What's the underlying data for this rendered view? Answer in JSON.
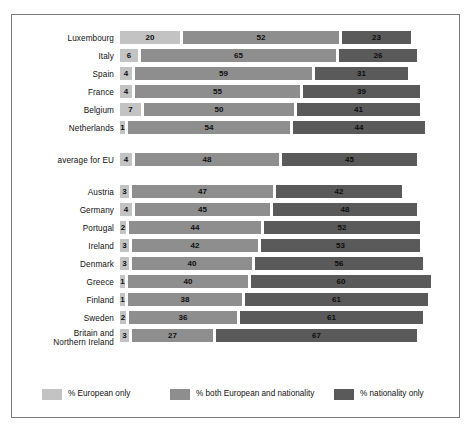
{
  "chart_data": {
    "type": "bar",
    "subtype": "stacked-horizontal",
    "title": "",
    "xlabel": "",
    "ylabel": "",
    "xlim": [
      0,
      100
    ],
    "grid": false,
    "legend_position": "bottom",
    "categories": [
      "Luxembourg",
      "Italy",
      "Spain",
      "France",
      "Belgium",
      "Netherlands",
      "average for EU",
      "Austria",
      "Germany",
      "Portugal",
      "Ireland",
      "Denmark",
      "Greece",
      "Finland",
      "Sweden",
      "Britain and\nNorthern Ireland"
    ],
    "series": [
      {
        "name": "% European only",
        "color": "#c3c3c3",
        "values": [
          20,
          6,
          4,
          4,
          7,
          1,
          4,
          3,
          4,
          2,
          3,
          3,
          1,
          1,
          2,
          3
        ]
      },
      {
        "name": "% both European and nationality",
        "color": "#8e8e8e",
        "values": [
          52,
          65,
          59,
          55,
          50,
          54,
          48,
          47,
          45,
          44,
          42,
          40,
          40,
          38,
          36,
          27
        ]
      },
      {
        "name": "% nationality only",
        "color": "#5a5a5a",
        "values": [
          23,
          26,
          31,
          39,
          41,
          44,
          45,
          42,
          48,
          52,
          53,
          56,
          60,
          61,
          61,
          67
        ]
      }
    ],
    "legend": [
      "% European only",
      "% both European and nationality",
      "% nationality only"
    ]
  },
  "rows": [
    {
      "label": "Luxembourg",
      "values": [
        20,
        52,
        23
      ],
      "tall": false
    },
    {
      "label": "Italy",
      "values": [
        6,
        65,
        26
      ],
      "tall": false
    },
    {
      "label": "Spain",
      "values": [
        4,
        59,
        31
      ],
      "tall": false
    },
    {
      "label": "France",
      "values": [
        4,
        55,
        39
      ],
      "tall": false
    },
    {
      "label": "Belgium",
      "values": [
        7,
        50,
        41
      ],
      "tall": false
    },
    {
      "label": "Netherlands",
      "values": [
        1,
        54,
        44
      ],
      "tall": false
    },
    {
      "label": "average for EU",
      "values": [
        4,
        48,
        45
      ],
      "tall": false
    },
    {
      "label": "Austria",
      "values": [
        3,
        47,
        42
      ],
      "tall": false
    },
    {
      "label": "Germany",
      "values": [
        4,
        45,
        48
      ],
      "tall": false
    },
    {
      "label": "Portugal",
      "values": [
        2,
        44,
        52
      ],
      "tall": false
    },
    {
      "label": "Ireland",
      "values": [
        3,
        42,
        53
      ],
      "tall": false
    },
    {
      "label": "Denmark",
      "values": [
        3,
        40,
        56
      ],
      "tall": false
    },
    {
      "label": "Greece",
      "values": [
        1,
        40,
        60
      ],
      "tall": false
    },
    {
      "label": "Finland",
      "values": [
        1,
        38,
        61
      ],
      "tall": false
    },
    {
      "label": "Sweden",
      "values": [
        2,
        36,
        61
      ],
      "tall": false
    },
    {
      "label": "Britain and\nNorthern Ireland",
      "values": [
        3,
        27,
        67
      ],
      "tall": true
    }
  ],
  "group_breaks_after": [
    5,
    6
  ],
  "legend": {
    "items": [
      {
        "label": "% European only",
        "swatch": "s1"
      },
      {
        "label": "% both European and nationality",
        "swatch": "s2"
      },
      {
        "label": "% nationality only",
        "swatch": "s3"
      }
    ]
  },
  "colors": {
    "european_only": "#c3c3c3",
    "both": "#8e8e8e",
    "nationality_only": "#5a5a5a",
    "frame": "#7a7a7a",
    "background": "#ffffff",
    "text": "#111111"
  },
  "scale": {
    "unit_px": 3.0,
    "gap_px": 3
  }
}
